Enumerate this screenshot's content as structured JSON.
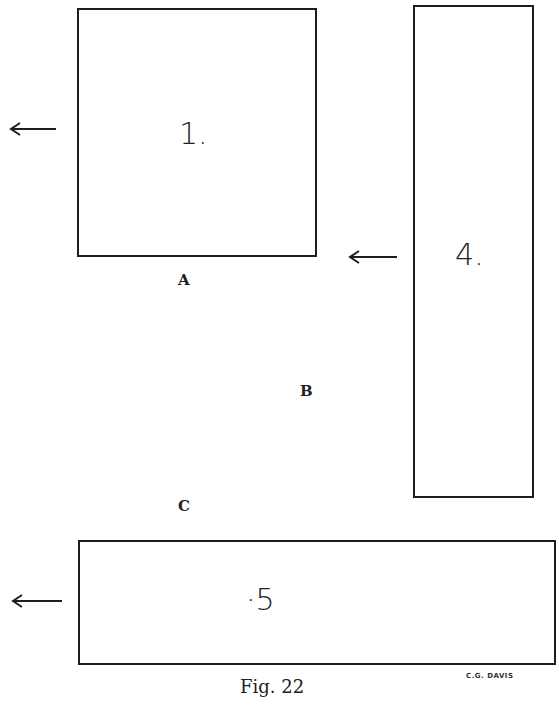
{
  "figure": {
    "caption": "Fig. 22",
    "signature": "C.G. DAVIS",
    "boxes": [
      {
        "id": "box-1",
        "label": "1."
      },
      {
        "id": "box-4",
        "label": "4."
      },
      {
        "id": "box-5",
        "label": "·5"
      }
    ],
    "letters": [
      "A",
      "B",
      "C"
    ],
    "arrows": [
      {
        "id": "arrow-left-box-1",
        "direction": "left"
      },
      {
        "id": "arrow-left-box-4",
        "direction": "left"
      },
      {
        "id": "arrow-left-box-5",
        "direction": "left"
      }
    ],
    "colors": {
      "ink": "#1e1e1e",
      "paper": "#ffffff"
    }
  }
}
